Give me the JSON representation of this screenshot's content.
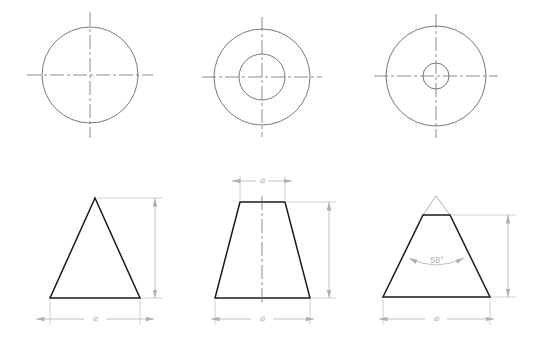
{
  "drawing": {
    "title": "Three-view engineering drawing of conical parts",
    "sheet_width": 540,
    "sheet_height": 342,
    "background_color": "#ffffff",
    "object_line_color": "#1a1a1a",
    "center_line_color": "#6e6e6e",
    "dimension_line_color": "#b3b3b3",
    "dimension_text_color": "#b8b8b8",
    "phantom_line_color": "#9a9a9a"
  },
  "views": {
    "top_left": {
      "name": "top-view-cone",
      "type": "circle-with-centerlines",
      "center": [
        90,
        75
      ],
      "outer_radius": 48,
      "inner_radius": null,
      "label": "Top view — plain cone"
    },
    "top_middle": {
      "name": "top-view-frustum",
      "type": "concentric-circles-with-centerlines",
      "center": [
        262,
        77
      ],
      "outer_radius": 48,
      "inner_radius": 23,
      "label": "Top view — truncated cone (large flat)"
    },
    "top_right": {
      "name": "top-view-truncated-cone",
      "type": "concentric-circles-with-centerlines",
      "center": [
        436,
        76
      ],
      "outer_radius": 50,
      "inner_radius": 13,
      "label": "Top view — truncated cone (small flat)"
    },
    "front_left": {
      "name": "front-view-cone",
      "type": "triangle",
      "apex": [
        95,
        198
      ],
      "base_left": [
        50,
        298
      ],
      "base_right": [
        140,
        298
      ],
      "label": "Front view — full cone"
    },
    "front_middle": {
      "name": "front-view-frustum",
      "type": "trapezoid",
      "top_left": [
        240,
        202
      ],
      "top_right": [
        285,
        202
      ],
      "bottom_left": [
        215,
        298
      ],
      "bottom_right": [
        310,
        298
      ],
      "label": "Front view — frustum"
    },
    "front_right": {
      "name": "front-view-truncated-cone",
      "type": "trapezoid-with-phantom-apex",
      "top_left": [
        423,
        215
      ],
      "top_right": [
        450,
        215
      ],
      "bottom_left": [
        383,
        297
      ],
      "bottom_right": [
        490,
        297
      ],
      "phantom_apex": [
        436,
        196
      ],
      "label": "Front view — truncated cone with apex construction"
    }
  },
  "dimensions": {
    "diameter_symbol": "⌀",
    "front_left": {
      "base_width_label": "⌀",
      "height_label": ""
    },
    "front_middle": {
      "top_width_label": "⌀",
      "base_width_label": "⌀",
      "height_label": ""
    },
    "front_right": {
      "base_width_label": "⌀",
      "height_label": "",
      "angle_label": "58°",
      "angle_value": 58,
      "angle_unit": "degrees"
    }
  }
}
